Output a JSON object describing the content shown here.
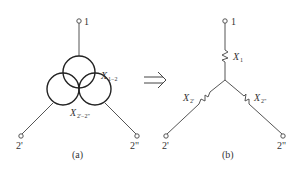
{
  "diagram": {
    "left": {
      "caption": "(a)",
      "terminals": {
        "top": "1",
        "bottom_left": "2'",
        "bottom_right": "2\""
      },
      "labels": {
        "x12_main": "X",
        "x12_sub": "1−2",
        "x22_main": "X",
        "x22_sub": "2'−2\""
      }
    },
    "arrow": {
      "symbol": "implies",
      "meaning": "transforms to"
    },
    "right": {
      "caption": "(b)",
      "terminals": {
        "top": "1",
        "bottom_left": "2'",
        "bottom_right": "2\""
      },
      "labels": {
        "x1_main": "X",
        "x1_sub": "1",
        "x2p_main": "X",
        "x2p_sub": "2'",
        "x2pp_main": "X",
        "x2pp_sub": "2\""
      }
    },
    "colors": {
      "line": "#555555",
      "text": "#333333",
      "background": "#ffffff"
    }
  }
}
